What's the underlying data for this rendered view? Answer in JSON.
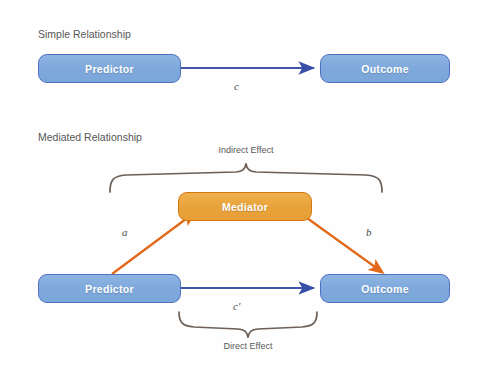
{
  "figure": {
    "background_color": "#fefefe",
    "width": 482,
    "height": 368
  },
  "colors": {
    "node_blue_fill": "#7fa9dc",
    "node_blue_border": "#4f6fc0",
    "node_orange_fill": "#e9a33c",
    "node_orange_border": "#d3780f",
    "arrow_blue": "#4054ab",
    "arrow_orange": "#e2691a",
    "brace": "#6b5f58",
    "label_text": "#585858",
    "node_text": "#ffffff"
  },
  "panels": {
    "simple": {
      "title": "Simple Relationship",
      "nodes": {
        "predictor": "Predictor",
        "outcome": "Outcome"
      },
      "paths": {
        "c": "c"
      }
    },
    "mediated": {
      "title": "Mediated Relationship",
      "nodes": {
        "predictor": "Predictor",
        "outcome": "Outcome",
        "mediator": "Mediator"
      },
      "paths": {
        "a": "a",
        "b": "b",
        "c_prime": "c′"
      },
      "braces": {
        "indirect": "Indirect Effect",
        "direct": "Direct Effect"
      }
    }
  }
}
